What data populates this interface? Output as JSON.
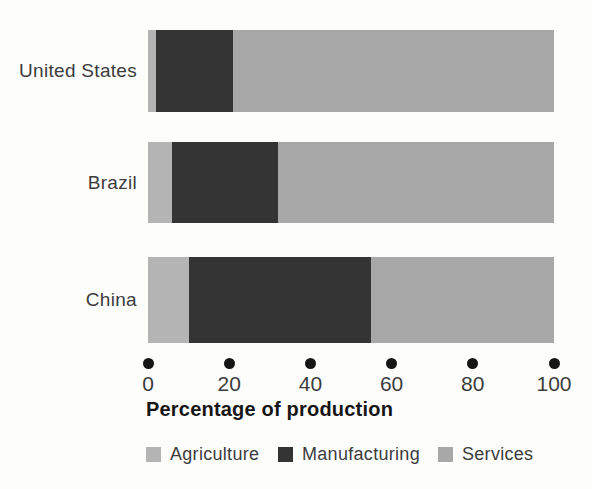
{
  "figure": {
    "background_color": "#fdfdfc",
    "text_color": "#3c3c3c"
  },
  "chart_data": {
    "type": "bar",
    "orientation": "horizontal",
    "stacked": true,
    "categories": [
      "United States",
      "Brazil",
      "China"
    ],
    "series": [
      {
        "name": "Agriculture",
        "color": "#b4b4b4",
        "values": [
          2,
          6,
          10
        ]
      },
      {
        "name": "Manufacturing",
        "color": "#343434",
        "values": [
          19,
          26,
          45
        ]
      },
      {
        "name": "Services",
        "color": "#a8a8a8",
        "values": [
          79,
          68,
          45
        ]
      }
    ],
    "title": "",
    "xlabel": "Percentage of production",
    "ylabel": "",
    "xlim": [
      0,
      100
    ],
    "x_ticks": [
      0,
      20,
      40,
      60,
      80,
      100
    ],
    "tick_marker": "filled-dot",
    "grid": false,
    "legend_position": "bottom"
  }
}
